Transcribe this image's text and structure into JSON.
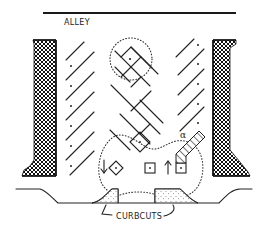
{
  "diagram": {
    "type": "site-plan-sketch",
    "labels": {
      "alley": "ALLEY",
      "curbcuts": "CURBCUTS"
    },
    "colors": {
      "ink": "#222222",
      "background": "#ffffff"
    },
    "elements": {
      "alley_line": {
        "description": "Alley edge at top"
      },
      "buildings": [
        {
          "side": "left",
          "fill": "crosshatch"
        },
        {
          "side": "right",
          "fill": "crosshatch"
        }
      ],
      "parking_rows": [
        {
          "side": "left",
          "stall_count": 7,
          "orientation": "diagonal"
        },
        {
          "side": "center",
          "stall_count": 6,
          "orientation": "herringbone"
        },
        {
          "side": "right",
          "stall_count": 6,
          "orientation": "diagonal"
        }
      ],
      "turning_circles": [
        {
          "location": "top-center",
          "style": "dotted"
        },
        {
          "location": "bottom",
          "style": "dotted"
        }
      ],
      "arrows": [
        {
          "direction": "down",
          "location": "left-entry"
        },
        {
          "direction": "up",
          "location": "right-exit"
        }
      ],
      "angle_marker": "α",
      "curbcuts": 2
    }
  }
}
